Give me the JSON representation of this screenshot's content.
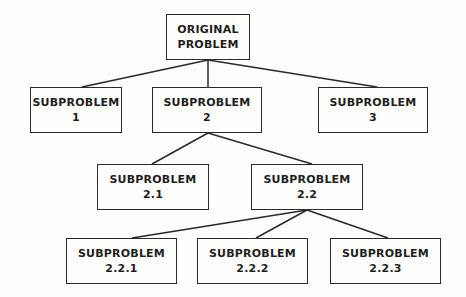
{
  "diagram": {
    "type": "tree",
    "root": "n0",
    "nodes": [
      {
        "id": "n0",
        "line1": "ORIGINAL",
        "line2": "PROBLEM",
        "x": 166,
        "y": 14,
        "w": 84,
        "h": 46
      },
      {
        "id": "n1",
        "line1": "SUBPROBLEM",
        "line2": "1",
        "x": 30,
        "y": 87,
        "w": 92,
        "h": 46
      },
      {
        "id": "n2",
        "line1": "SUBPROBLEM",
        "line2": "2",
        "x": 152,
        "y": 87,
        "w": 110,
        "h": 46
      },
      {
        "id": "n3",
        "line1": "SUBPROBLEM",
        "line2": "3",
        "x": 318,
        "y": 87,
        "w": 110,
        "h": 46
      },
      {
        "id": "n21",
        "line1": "SUBPROBLEM",
        "line2": "2.1",
        "x": 97,
        "y": 164,
        "w": 112,
        "h": 46
      },
      {
        "id": "n22",
        "line1": "SUBPROBLEM",
        "line2": "2.2",
        "x": 251,
        "y": 164,
        "w": 112,
        "h": 46
      },
      {
        "id": "n221",
        "line1": "SUBPROBLEM",
        "line2": "2.2.1",
        "x": 66,
        "y": 238,
        "w": 111,
        "h": 46
      },
      {
        "id": "n222",
        "line1": "SUBPROBLEM",
        "line2": "2.2.2",
        "x": 197,
        "y": 238,
        "w": 111,
        "h": 46
      },
      {
        "id": "n223",
        "line1": "SUBPROBLEM",
        "line2": "2.2.3",
        "x": 330,
        "y": 238,
        "w": 111,
        "h": 46
      }
    ],
    "edges": [
      {
        "from": "n0",
        "to": "n1",
        "x1": 208,
        "y1": 60,
        "x2": 82,
        "y2": 87
      },
      {
        "from": "n0",
        "to": "n2",
        "x1": 208,
        "y1": 60,
        "x2": 208,
        "y2": 87
      },
      {
        "from": "n0",
        "to": "n3",
        "x1": 208,
        "y1": 60,
        "x2": 377,
        "y2": 87
      },
      {
        "from": "n2",
        "to": "n21",
        "x1": 208,
        "y1": 133,
        "x2": 152,
        "y2": 164
      },
      {
        "from": "n2",
        "to": "n22",
        "x1": 208,
        "y1": 133,
        "x2": 312,
        "y2": 164
      },
      {
        "from": "n22",
        "to": "n221",
        "x1": 307,
        "y1": 210,
        "x2": 132,
        "y2": 238
      },
      {
        "from": "n22",
        "to": "n222",
        "x1": 307,
        "y1": 210,
        "x2": 256,
        "y2": 238
      },
      {
        "from": "n22",
        "to": "n223",
        "x1": 307,
        "y1": 210,
        "x2": 388,
        "y2": 238
      }
    ],
    "colors": {
      "line": "#2a2a2a",
      "background": "#fdfdfb",
      "text": "#1e1e1e"
    }
  }
}
